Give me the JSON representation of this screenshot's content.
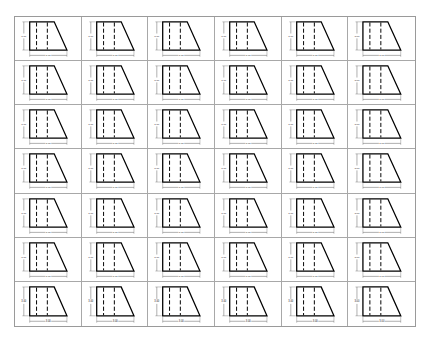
{
  "worksheet": {
    "rows": 7,
    "columns": 6,
    "grid_color": "#a8a8a8",
    "shape": {
      "type": "trapezoid-prism-front-view",
      "outline_color": "#000000",
      "hidden_lines": 2,
      "height_label": "3.00",
      "width_label": "3.00"
    }
  }
}
